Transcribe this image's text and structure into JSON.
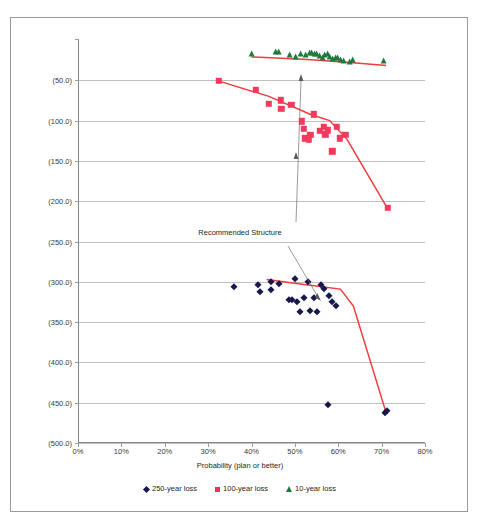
{
  "faint_header": "",
  "chart_data": {
    "type": "scatter",
    "title": "",
    "xlabel": "Probability (plan or better)",
    "ylabel": "",
    "xlim": [
      0,
      80
    ],
    "ylim": [
      -500,
      0
    ],
    "x_ticks": [
      "0%",
      "10%",
      "20%",
      "30%",
      "40%",
      "50%",
      "60%",
      "70%",
      "80%"
    ],
    "x_tick_values": [
      0,
      10,
      20,
      30,
      40,
      50,
      60,
      70,
      80
    ],
    "y_ticks": [
      "(50.0)",
      "(100.0)",
      "(150.0)",
      "(200.0)",
      "(250.0)",
      "(300.0)",
      "(350.0)",
      "(400.0)",
      "(450.0)",
      "(500.0)"
    ],
    "y_tick_values": [
      -50,
      -100,
      -150,
      -200,
      -250,
      -300,
      -350,
      -400,
      -450,
      -500
    ],
    "grid": "horizontal",
    "legend_position": "bottom",
    "annotations": [
      {
        "text": "Recommended Structure",
        "x": 50,
        "y": -228
      }
    ],
    "series": [
      {
        "name": "10-year loss",
        "marker": "triangle",
        "color": "#1f7a3d",
        "points": [
          [
            40.2,
            -20.5
          ],
          [
            45.6,
            -19.0
          ],
          [
            46.4,
            -19.2
          ],
          [
            48.8,
            -22.0
          ],
          [
            50.2,
            -24.5
          ],
          [
            51.4,
            -21.5
          ],
          [
            52.6,
            -22.5
          ],
          [
            53.4,
            -20.0
          ],
          [
            54.0,
            -19.5
          ],
          [
            54.6,
            -20.5
          ],
          [
            55.2,
            -21.5
          ],
          [
            55.8,
            -24.0
          ],
          [
            56.4,
            -26.0
          ],
          [
            57.0,
            -22.5
          ],
          [
            57.6,
            -21.0
          ],
          [
            58.2,
            -24.5
          ],
          [
            58.8,
            -27.0
          ],
          [
            59.4,
            -25.5
          ],
          [
            60.0,
            -26.5
          ],
          [
            60.6,
            -28.5
          ],
          [
            61.4,
            -30.0
          ],
          [
            62.6,
            -30.5
          ],
          [
            63.4,
            -28.0
          ],
          [
            70.6,
            -30.0
          ]
        ]
      },
      {
        "name": "100-year loss",
        "marker": "square",
        "color": "#f33a5c",
        "points": [
          [
            32.4,
            -50.5
          ],
          [
            41.0,
            -62.0
          ],
          [
            44.0,
            -79.0
          ],
          [
            46.8,
            -75.0
          ],
          [
            46.9,
            -85.0
          ],
          [
            49.2,
            -80.5
          ],
          [
            51.6,
            -101.0
          ],
          [
            52.0,
            -110.0
          ],
          [
            52.4,
            -122.0
          ],
          [
            53.2,
            -124.0
          ],
          [
            53.6,
            -118.0
          ],
          [
            54.4,
            -92.0
          ],
          [
            55.8,
            -113.0
          ],
          [
            56.6,
            -108.0
          ],
          [
            57.0,
            -117.0
          ],
          [
            57.6,
            -112.0
          ],
          [
            58.6,
            -138.0
          ],
          [
            59.6,
            -108.0
          ],
          [
            60.4,
            -122.0
          ],
          [
            61.6,
            -118.0
          ],
          [
            71.4,
            -208.0
          ]
        ]
      },
      {
        "name": "250-year loss",
        "marker": "diamond",
        "color": "#18184c",
        "points": [
          [
            36.0,
            -306.0
          ],
          [
            41.4,
            -304.0
          ],
          [
            42.0,
            -313.0
          ],
          [
            44.4,
            -300.0
          ],
          [
            44.6,
            -310.0
          ],
          [
            46.4,
            -303.0
          ],
          [
            48.6,
            -323.0
          ],
          [
            49.4,
            -322.0
          ],
          [
            50.0,
            -297.0
          ],
          [
            50.6,
            -325.0
          ],
          [
            51.2,
            -338.0
          ],
          [
            52.0,
            -320.0
          ],
          [
            53.0,
            -300.0
          ],
          [
            53.4,
            -336.0
          ],
          [
            54.4,
            -320.0
          ],
          [
            55.0,
            -337.0
          ],
          [
            56.0,
            -304.0
          ],
          [
            56.6,
            -309.0
          ],
          [
            57.8,
            -318.0
          ],
          [
            58.6,
            -325.0
          ],
          [
            59.4,
            -330.0
          ],
          [
            57.6,
            -453.0
          ],
          [
            70.8,
            -463.0
          ],
          [
            71.2,
            -460.0
          ]
        ]
      }
    ],
    "trend_lines": [
      {
        "name": "10-year trend",
        "color": "#ee3b3b",
        "points": [
          [
            40.0,
            -21.0
          ],
          [
            52.0,
            -24.0
          ],
          [
            62.0,
            -27.5
          ],
          [
            71.0,
            -31.5
          ]
        ]
      },
      {
        "name": "100-year trend",
        "color": "#ee3b3b",
        "points": [
          [
            32.5,
            -51.0
          ],
          [
            44.0,
            -70.0
          ],
          [
            53.5,
            -92.0
          ],
          [
            58.0,
            -100.0
          ],
          [
            62.0,
            -123.0
          ],
          [
            71.5,
            -210.0
          ]
        ]
      },
      {
        "name": "250-year trend",
        "color": "#ee3b3b",
        "points": [
          [
            43.5,
            -297.0
          ],
          [
            53.0,
            -304.0
          ],
          [
            60.5,
            -309.0
          ],
          [
            63.5,
            -330.0
          ],
          [
            71.0,
            -462.0
          ]
        ]
      }
    ]
  },
  "legend": {
    "items": [
      {
        "label": "250-year loss",
        "marker": "diamond",
        "color": "#18184c"
      },
      {
        "label": "100-year loss",
        "marker": "square",
        "color": "#ee3356"
      },
      {
        "label": "10-year loss",
        "marker": "triangle",
        "color": "#1f7a3d"
      }
    ]
  }
}
